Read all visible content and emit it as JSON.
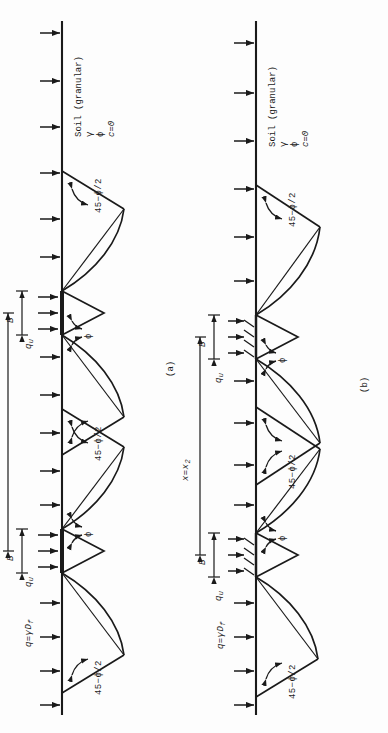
{
  "figure": {
    "caption_a": "(a)",
    "caption_b": "(b)",
    "panels": [
      {
        "id": "a",
        "label": "(a)",
        "spacing_label": "x=x",
        "spacing_sub": "1",
        "surcharge_label": "q=γD",
        "surcharge_sub": "f",
        "bearing_label": "q",
        "bearing_sub": "u",
        "width_label": "B",
        "wedge_angle_label": "45−ϕ/2",
        "shear_angle_label": "ϕ",
        "soil_title": "Soil (granular)",
        "soil_line1": "γ",
        "soil_line2": "ϕ",
        "soil_line3": "c=0",
        "n_footings": 2,
        "footing_hatched": false
      },
      {
        "id": "b",
        "label": "(b)",
        "spacing_label": "x=x",
        "spacing_sub": "2",
        "surcharge_label": "q=γD",
        "surcharge_sub": "f",
        "bearing_label": "q",
        "bearing_sub": "u",
        "width_label": "B",
        "wedge_angle_label": "45−ϕ/2",
        "shear_angle_label": "ϕ",
        "soil_title": "Soil (granular)",
        "soil_line1": "γ",
        "soil_line2": "ϕ",
        "soil_line3": "c=0",
        "n_footings": 2,
        "footing_hatched": true
      }
    ]
  },
  "colors": {
    "ink": "#1a1a1a",
    "paper": "#fdfdfd",
    "line": "#222222"
  }
}
